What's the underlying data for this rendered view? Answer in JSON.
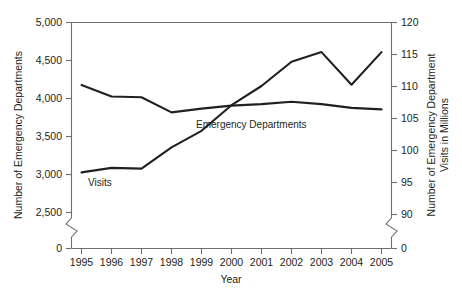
{
  "chart_data": {
    "type": "line",
    "title": "",
    "xlabel": "Year",
    "ylabel": "Number of Emergency Departments",
    "y2label": "Number of Emergency Department Visits in Millions",
    "categories": [
      "1995",
      "1996",
      "1997",
      "1998",
      "1999",
      "2000",
      "2001",
      "2002",
      "2003",
      "2004",
      "2005"
    ],
    "series": [
      {
        "name": "Emergency Departments",
        "axis": "left",
        "values": [
          4170,
          4020,
          4010,
          3810,
          3860,
          3900,
          3920,
          3950,
          3920,
          3870,
          3850
        ]
      },
      {
        "name": "Visits",
        "axis": "right",
        "values": [
          96.5,
          97.2,
          97.1,
          100.4,
          103.0,
          107.0,
          110.0,
          113.8,
          115.3,
          110.2,
          115.3
        ]
      }
    ],
    "ylim": [
      2400,
      5000
    ],
    "y2lim": [
      89,
      120
    ],
    "yticks": [
      "0",
      "2,500",
      "3,000",
      "3,500",
      "4,000",
      "4,500",
      "5,000"
    ],
    "y2ticks": [
      "0",
      "90",
      "95",
      "100",
      "105",
      "110",
      "115",
      "120"
    ],
    "grid": false,
    "legend_position": "inline-annotations",
    "axis_break_left": true,
    "axis_break_right": true,
    "annotations": [
      {
        "text": "Visits",
        "series": "Visits"
      },
      {
        "text": "Emergency Departments",
        "series": "Emergency Departments"
      }
    ],
    "colors": {
      "line": "#231f20",
      "axis": "#6d6e71",
      "background": "#ffffff"
    }
  }
}
